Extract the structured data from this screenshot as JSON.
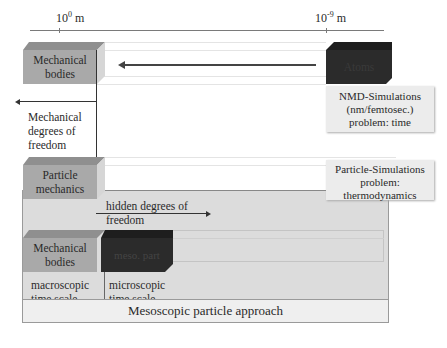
{
  "scale": {
    "left_label_base": "10",
    "left_label_exp": "0",
    "left_label_unit": " m",
    "right_label_base": "10",
    "right_label_exp": "-9",
    "right_label_unit": " m"
  },
  "boxes": {
    "mechanical_bodies_top": "Mechanical bodies",
    "atoms": "Atoms",
    "particle_mechanics": "Particle mechanics",
    "mechanical_bodies_bottom": "Mechanical bodies",
    "meso_part": "meso. part"
  },
  "notes": {
    "nmd": [
      "NMD-Simulations",
      "(nm/femtosec.)",
      "problem: time"
    ],
    "particle_sim": [
      "Particle-Simulations",
      "problem:",
      "thermodynamics"
    ]
  },
  "labels": {
    "mechanical_dof": [
      "Mechanical",
      "degrees of",
      "freedom"
    ],
    "hidden_dof": [
      "hidden degrees of",
      "freedom"
    ],
    "macroscopic": [
      "macroscopic",
      "time scale"
    ],
    "microscopic": [
      "microscopic",
      "time scale"
    ],
    "footer": "Mesoscopic particle approach"
  },
  "colors": {
    "light_box": "#a9a9a9",
    "light_box_top": "#8f8f8f",
    "dark_box": "#2b2b2b",
    "dark_box_top": "#1e1e1e",
    "panel": "#dcdcdc",
    "footer_panel": "#efefef"
  }
}
